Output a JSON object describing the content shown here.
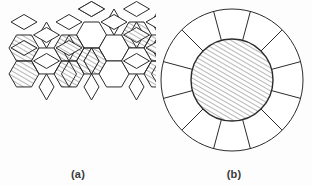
{
  "figure": {
    "background_color": "#fdfdfd",
    "stroke_color": "#2b2b2b",
    "hatch_color": "#4a4a4a",
    "fill_color": "#ffffff",
    "panels": [
      {
        "id": "a",
        "caption": "(a)",
        "kind": "rhombi-hexagon-tiling",
        "description": "Planar tiling of elongated hexagons and rhombi, some cells hatched",
        "hatch_angle_deg": 60,
        "hatch_spacing_px": 3
      },
      {
        "id": "b",
        "caption": "(b)",
        "kind": "radial-annulus-diagram",
        "description": "Hatched central disc surrounded by an annular ring divided into 12 radial segments",
        "segment_count": 12,
        "hatch_angle_deg": 60,
        "hatch_spacing_px": 3,
        "center_x": 232,
        "center_y": 80,
        "inner_radius": 41,
        "outer_radius": 71
      }
    ]
  },
  "chart_data": {
    "type": "diagram",
    "title": "",
    "panels": [
      {
        "label": "(a)",
        "type": "tiling",
        "tile_types": [
          "hexagon",
          "rhombus"
        ],
        "hexagon_count": 13,
        "rhombus_count": 34,
        "hatched_hexagons": 9
      },
      {
        "label": "(b)",
        "type": "radial",
        "segments": 12,
        "inner_radius": 41,
        "outer_radius": 71,
        "hatched_region": "inner disc"
      }
    ]
  }
}
